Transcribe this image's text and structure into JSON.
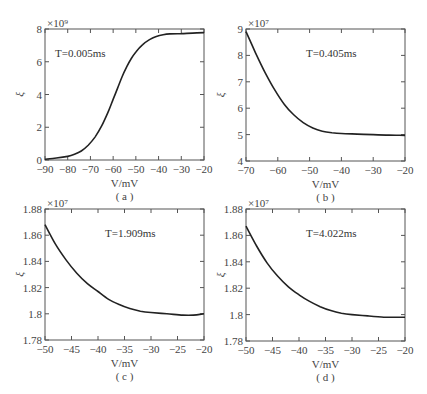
{
  "chart_data": [
    {
      "id": "a",
      "type": "line",
      "caption": "( a )",
      "annotation": "T=0.005ms",
      "xlabel": "V/mV",
      "ylabel": "ξ",
      "multiplier": "×10⁹",
      "xlim": [
        -90,
        -20
      ],
      "ylim": [
        0,
        8
      ],
      "xticks": [
        -90,
        -80,
        -70,
        -60,
        -50,
        -40,
        -30,
        -20
      ],
      "yticks": [
        0,
        2,
        4,
        6,
        8
      ],
      "yticklabels": [
        "0",
        "2",
        "4",
        "6",
        "8"
      ],
      "x": [
        -90,
        -85,
        -80,
        -77,
        -74,
        -71,
        -68,
        -65,
        -62,
        -60,
        -58,
        -56,
        -54,
        -52,
        -50,
        -47,
        -44,
        -41,
        -38,
        -35,
        -30,
        -25,
        -20
      ],
      "y": [
        0.05,
        0.12,
        0.22,
        0.35,
        0.55,
        0.9,
        1.4,
        2.1,
        3.0,
        3.7,
        4.4,
        5.1,
        5.7,
        6.2,
        6.6,
        7.05,
        7.35,
        7.55,
        7.65,
        7.7,
        7.72,
        7.75,
        7.78
      ],
      "box": {
        "left": 45,
        "top": 29,
        "right": 204,
        "bottom": 160
      }
    },
    {
      "id": "b",
      "type": "line",
      "caption": "( b )",
      "annotation": "T=0.405ms",
      "xlabel": "V/mV",
      "ylabel": "ξ",
      "multiplier": "×10⁷",
      "xlim": [
        -70,
        -20
      ],
      "ylim": [
        4,
        9
      ],
      "xticks": [
        -70,
        -60,
        -50,
        -40,
        -30,
        -20
      ],
      "yticks": [
        4,
        5,
        6,
        7,
        8,
        9
      ],
      "yticklabels": [
        "4",
        "5",
        "6",
        "7",
        "8",
        "9"
      ],
      "x": [
        -70,
        -67,
        -64,
        -61,
        -58,
        -55,
        -52,
        -49,
        -46,
        -43,
        -40,
        -35,
        -30,
        -25,
        -20
      ],
      "y": [
        8.9,
        8.1,
        7.35,
        6.7,
        6.15,
        5.75,
        5.45,
        5.25,
        5.13,
        5.07,
        5.04,
        5.02,
        5.0,
        4.98,
        4.97
      ],
      "box": {
        "left": 246,
        "top": 29,
        "right": 405,
        "bottom": 161
      }
    },
    {
      "id": "c",
      "type": "line",
      "caption": "( c )",
      "annotation": "T=1.909ms",
      "xlabel": "V/mV",
      "ylabel": "ξ",
      "multiplier": "×10⁷",
      "xlim": [
        -50,
        -20
      ],
      "ylim": [
        1.78,
        1.88
      ],
      "xticks": [
        -50,
        -45,
        -40,
        -35,
        -30,
        -25,
        -20
      ],
      "yticks": [
        1.78,
        1.8,
        1.82,
        1.84,
        1.86,
        1.88
      ],
      "yticklabels": [
        "1.78",
        "1.8",
        "1.82",
        "1.84",
        "1.86",
        "1.88"
      ],
      "x": [
        -50,
        -48,
        -46,
        -44,
        -42,
        -40,
        -38,
        -36,
        -34,
        -32,
        -30,
        -27,
        -24,
        -22,
        -20
      ],
      "y": [
        1.868,
        1.853,
        1.841,
        1.831,
        1.823,
        1.817,
        1.811,
        1.807,
        1.804,
        1.802,
        1.801,
        1.8,
        1.799,
        1.799,
        1.8
      ],
      "box": {
        "left": 45,
        "top": 209,
        "right": 204,
        "bottom": 340
      }
    },
    {
      "id": "d",
      "type": "line",
      "caption": "( d )",
      "annotation": "T=4.022ms",
      "xlabel": "V/mV",
      "ylabel": "ξ",
      "multiplier": "×10⁷",
      "xlim": [
        -50,
        -20
      ],
      "ylim": [
        1.78,
        1.88
      ],
      "xticks": [
        -50,
        -45,
        -40,
        -35,
        -30,
        -25,
        -20
      ],
      "yticks": [
        1.78,
        1.8,
        1.82,
        1.84,
        1.86,
        1.88
      ],
      "yticklabels": [
        "1.78",
        "1.8",
        "1.82",
        "1.84",
        "1.86",
        "1.88"
      ],
      "x": [
        -50,
        -48,
        -46,
        -44,
        -42,
        -40,
        -38,
        -36,
        -34,
        -32,
        -30,
        -27,
        -24,
        -22,
        -20
      ],
      "y": [
        1.867,
        1.852,
        1.839,
        1.829,
        1.821,
        1.815,
        1.81,
        1.806,
        1.803,
        1.801,
        1.8,
        1.799,
        1.798,
        1.798,
        1.798
      ],
      "box": {
        "left": 246,
        "top": 209,
        "right": 405,
        "bottom": 341
      }
    }
  ]
}
